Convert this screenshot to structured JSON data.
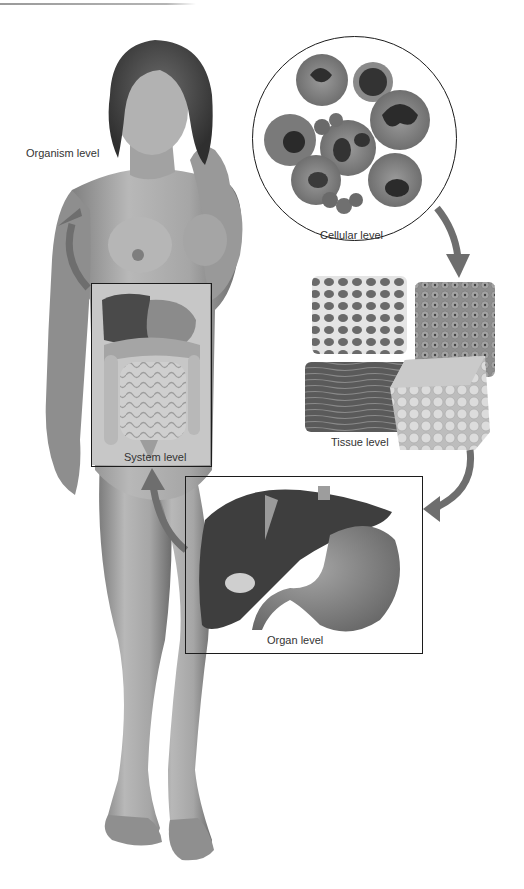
{
  "diagram": {
    "levels": [
      {
        "id": "organism",
        "label": "Organism level"
      },
      {
        "id": "system",
        "label": "System level"
      },
      {
        "id": "organ",
        "label": "Organ level"
      },
      {
        "id": "tissue",
        "label": "Tissue level"
      },
      {
        "id": "cellular",
        "label": "Cellular level"
      }
    ],
    "flow": [
      "Cellular level",
      "Tissue level",
      "Organ level",
      "System level",
      "Organism level"
    ],
    "colors": {
      "arrow": "#6e6e6e",
      "arrow_highlight": "#9a9a9a",
      "frame": "#1c1c1c",
      "skin": "#a9a9a9",
      "liver": "#3e3e3e",
      "stomach": "#8a8a8a"
    }
  }
}
